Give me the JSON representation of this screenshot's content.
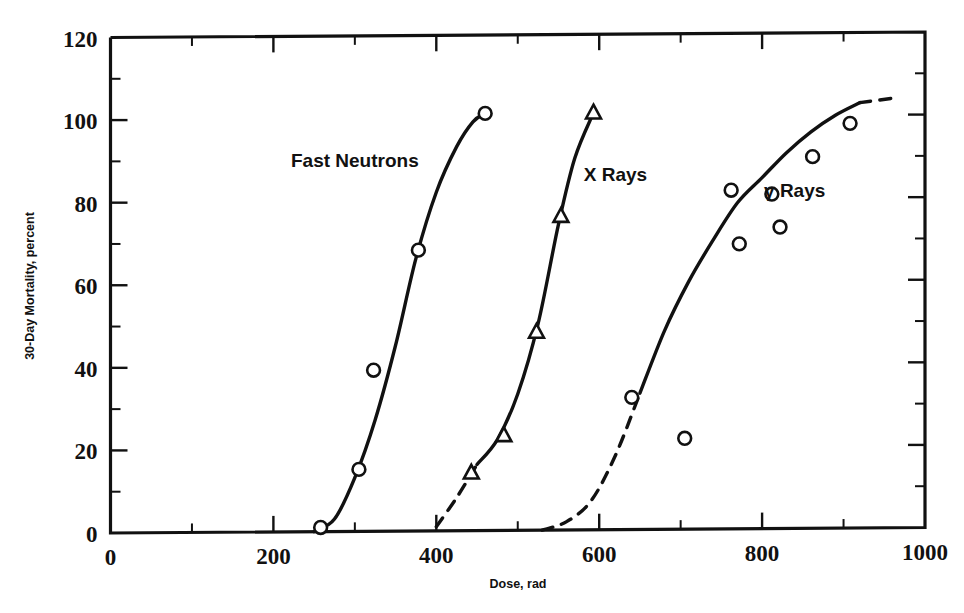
{
  "chart_data": {
    "type": "scatter",
    "title": "",
    "xlabel": "Dose, rad",
    "ylabel": "30-Day Mortality, percent",
    "xlim": [
      0,
      1000
    ],
    "ylim": [
      0,
      120
    ],
    "xticks": [
      0,
      200,
      400,
      600,
      800,
      1000
    ],
    "xtick_labels": [
      "0",
      "200",
      "400",
      "600",
      "800",
      "1000"
    ],
    "xticks_minor": [
      100,
      300,
      500,
      700,
      900
    ],
    "yticks": [
      0,
      20,
      40,
      60,
      80,
      100,
      120
    ],
    "ytick_labels": [
      "0",
      "20",
      "40",
      "60",
      "80",
      "100",
      "120"
    ],
    "yticks_minor": [
      10,
      30,
      50,
      70,
      90,
      110
    ],
    "grid": false,
    "legend": "inline annotations",
    "series": [
      {
        "name": "Fast Neutrons",
        "marker": "circle",
        "label_x": 300,
        "label_y": 90,
        "points": [
          {
            "x": 258,
            "y": 1
          },
          {
            "x": 305,
            "y": 15
          },
          {
            "x": 323,
            "y": 39
          },
          {
            "x": 378,
            "y": 68
          },
          {
            "x": 460,
            "y": 101
          }
        ],
        "fit_curve": [
          {
            "x": 250,
            "y": 0
          },
          {
            "x": 275,
            "y": 3
          },
          {
            "x": 300,
            "y": 13
          },
          {
            "x": 325,
            "y": 27
          },
          {
            "x": 350,
            "y": 45
          },
          {
            "x": 375,
            "y": 66
          },
          {
            "x": 400,
            "y": 82
          },
          {
            "x": 425,
            "y": 93
          },
          {
            "x": 445,
            "y": 99
          },
          {
            "x": 460,
            "y": 101
          }
        ],
        "fit_dashed": false
      },
      {
        "name": "X Rays",
        "marker": "triangle",
        "label_x": 620,
        "label_y": 86,
        "points": [
          {
            "x": 443,
            "y": 14
          },
          {
            "x": 483,
            "y": 23
          },
          {
            "x": 523,
            "y": 48
          },
          {
            "x": 553,
            "y": 76
          },
          {
            "x": 593,
            "y": 101
          }
        ],
        "fit_curve": [
          {
            "x": 400,
            "y": 1
          },
          {
            "x": 425,
            "y": 8
          },
          {
            "x": 450,
            "y": 16
          },
          {
            "x": 475,
            "y": 22
          },
          {
            "x": 500,
            "y": 33
          },
          {
            "x": 525,
            "y": 50
          },
          {
            "x": 550,
            "y": 74
          },
          {
            "x": 570,
            "y": 90
          },
          {
            "x": 593,
            "y": 101
          }
        ],
        "fit_solid_from": 450,
        "fit_dashed_before": 450
      },
      {
        "name": "γ Rays",
        "marker": "circle",
        "label_x": 840,
        "label_y": 82,
        "points": [
          {
            "x": 640,
            "y": 32
          },
          {
            "x": 705,
            "y": 22
          },
          {
            "x": 762,
            "y": 82
          },
          {
            "x": 772,
            "y": 69
          },
          {
            "x": 812,
            "y": 81
          },
          {
            "x": 822,
            "y": 73
          },
          {
            "x": 862,
            "y": 90
          },
          {
            "x": 908,
            "y": 98
          }
        ],
        "fit_curve": [
          {
            "x": 530,
            "y": 0
          },
          {
            "x": 560,
            "y": 2
          },
          {
            "x": 590,
            "y": 7
          },
          {
            "x": 620,
            "y": 18
          },
          {
            "x": 650,
            "y": 33
          },
          {
            "x": 680,
            "y": 48
          },
          {
            "x": 710,
            "y": 60
          },
          {
            "x": 740,
            "y": 70
          },
          {
            "x": 770,
            "y": 79
          },
          {
            "x": 800,
            "y": 85
          },
          {
            "x": 830,
            "y": 91
          },
          {
            "x": 860,
            "y": 96
          },
          {
            "x": 890,
            "y": 100
          },
          {
            "x": 920,
            "y": 103
          },
          {
            "x": 960,
            "y": 104
          }
        ],
        "fit_solid_from": 650,
        "fit_solid_to": 890,
        "fit_dashed_before": 650,
        "fit_dashed_after": 890
      }
    ]
  },
  "annotations": {
    "fast_neutrons": "Fast Neutrons",
    "x_rays": "X Rays",
    "gamma_rays": "γ Rays"
  },
  "axes": {
    "x_title": "Dose, rad",
    "y_title": "30-Day Mortality, percent",
    "x_tick_labels": [
      "0",
      "200",
      "400",
      "600",
      "800",
      "1000"
    ],
    "y_tick_labels": [
      "0",
      "20",
      "40",
      "60",
      "80",
      "100",
      "120"
    ]
  },
  "colors": {
    "ink": "#111111",
    "background": "#ffffff",
    "marker_fill": "#ffffff"
  }
}
